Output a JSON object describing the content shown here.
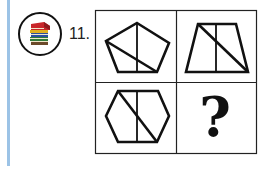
{
  "question": {
    "number_label": "11.",
    "icon": "books-stack-icon",
    "grid": {
      "rows": 2,
      "cols": 2,
      "cells": [
        {
          "position": "top-left",
          "shape": "pentagon",
          "lines": [
            "vertical center line",
            "diagonal"
          ]
        },
        {
          "position": "top-right",
          "shape": "trapezoid",
          "lines": [
            "vertical center line",
            "diagonal"
          ]
        },
        {
          "position": "bottom-left",
          "shape": "hexagon",
          "lines": [
            "vertical center line",
            "diagonal"
          ]
        },
        {
          "position": "bottom-right",
          "shape": "unknown",
          "label": "?"
        }
      ]
    }
  },
  "colors": {
    "accent_bar": "#9cc3e6",
    "stroke": "#111111"
  }
}
